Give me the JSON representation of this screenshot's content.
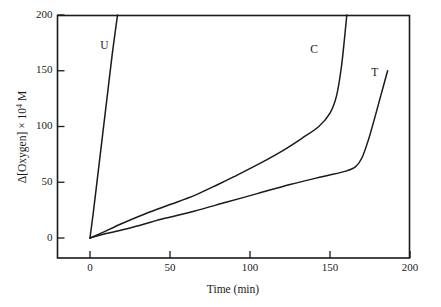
{
  "figure": {
    "background_color": "#ffffff",
    "line_color": "#1a1a1a"
  },
  "chart_data": {
    "type": "line",
    "title": "",
    "subtitle": "",
    "xlabel": "Time (min)",
    "ylabel_parts": {
      "prefix": "Δ[Oxygen] × 10",
      "exponent": "4",
      "suffix": " M"
    },
    "ylabel": "Δ[Oxygen] × 10⁴ M",
    "xlim": [
      0,
      200
    ],
    "ylim": [
      0,
      200
    ],
    "xticks": [
      0,
      50,
      100,
      150,
      200
    ],
    "xtick_labels": [
      "0",
      "50",
      "100",
      "150",
      "200"
    ],
    "yticks": [
      0,
      50,
      100,
      150,
      200
    ],
    "ytick_labels": [
      "0",
      "50",
      "100",
      "150",
      "200"
    ],
    "grid": false,
    "legend": "inline-curve-labels",
    "series": [
      {
        "name": "U",
        "label": "U",
        "label_position": {
          "x": 9,
          "y": 172
        },
        "description": "Uninhibited: rapid near-linear oxygen uptake, exits top of axes at about 17 min",
        "points": [
          {
            "x": 0,
            "y": 0
          },
          {
            "x": 2,
            "y": 22
          },
          {
            "x": 5,
            "y": 58
          },
          {
            "x": 8,
            "y": 94
          },
          {
            "x": 11,
            "y": 130
          },
          {
            "x": 14,
            "y": 166
          },
          {
            "x": 17.2,
            "y": 200
          }
        ]
      },
      {
        "name": "C",
        "label": "C",
        "label_position": {
          "x": 140,
          "y": 168
        },
        "description": "Slow autoxidation with induction period; knee near 100 at 143 min, then steep rise off-scale at about 160 min",
        "points": [
          {
            "x": 0,
            "y": 0
          },
          {
            "x": 8,
            "y": 5
          },
          {
            "x": 20,
            "y": 13
          },
          {
            "x": 35,
            "y": 22
          },
          {
            "x": 50,
            "y": 30
          },
          {
            "x": 65,
            "y": 38
          },
          {
            "x": 80,
            "y": 48
          },
          {
            "x": 90,
            "y": 55
          },
          {
            "x": 105,
            "y": 66
          },
          {
            "x": 120,
            "y": 78
          },
          {
            "x": 132,
            "y": 89
          },
          {
            "x": 143,
            "y": 100
          },
          {
            "x": 150,
            "y": 112
          },
          {
            "x": 154,
            "y": 127
          },
          {
            "x": 157,
            "y": 152
          },
          {
            "x": 159,
            "y": 178
          },
          {
            "x": 160.5,
            "y": 200
          }
        ]
      },
      {
        "name": "T",
        "label": "T",
        "label_position": {
          "x": 178,
          "y": 148
        },
        "description": "Longest induction period; knee near 72 at 170 min, then steep rise ending at 150 at 186 min",
        "points": [
          {
            "x": 0,
            "y": 0
          },
          {
            "x": 10,
            "y": 4
          },
          {
            "x": 25,
            "y": 9
          },
          {
            "x": 45,
            "y": 17
          },
          {
            "x": 65,
            "y": 24
          },
          {
            "x": 85,
            "y": 32
          },
          {
            "x": 105,
            "y": 40
          },
          {
            "x": 125,
            "y": 48
          },
          {
            "x": 145,
            "y": 55
          },
          {
            "x": 160,
            "y": 60
          },
          {
            "x": 166,
            "y": 64
          },
          {
            "x": 170,
            "y": 72
          },
          {
            "x": 174,
            "y": 88
          },
          {
            "x": 178,
            "y": 108
          },
          {
            "x": 182,
            "y": 129
          },
          {
            "x": 186,
            "y": 150
          }
        ]
      }
    ]
  }
}
